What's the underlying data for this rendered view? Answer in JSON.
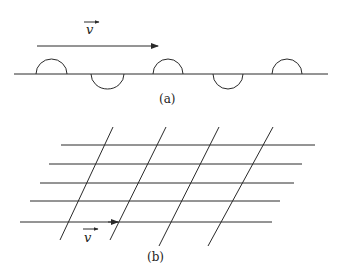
{
  "figure_a": {
    "caption": "(a)",
    "velocity_label": "v",
    "description": "Wave packets (alternating up/down semicircular bumps) on a line moving right with velocity v"
  },
  "figure_b": {
    "caption": "(b)",
    "velocity_label": "v",
    "description": "Grid of horizontal lines crossed by slanted lines; arrow indicates velocity v along bottom line"
  },
  "colors": {
    "stroke": "#2a2a2a",
    "background": "#ffffff"
  }
}
